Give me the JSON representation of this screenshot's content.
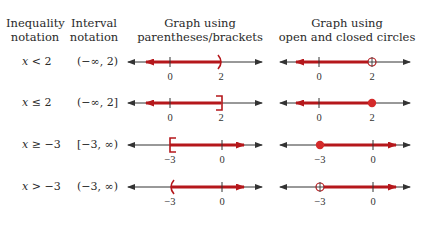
{
  "headers": {
    "inequality": [
      "Inequality",
      "notation"
    ],
    "interval": [
      "Interval",
      "notation"
    ],
    "brackets": [
      "Graph using",
      "parentheses/brackets"
    ],
    "circles": [
      "Graph using",
      "open and closed circles"
    ]
  },
  "rows": [
    {
      "inequality_var": "x",
      "inequality_rest": " < 2",
      "interval": "(−∞, 2)",
      "tick_labels": [
        "0",
        "2"
      ],
      "endpoint": 2,
      "direction": "left",
      "bracket_style": "parenthesis",
      "circle_style": "open"
    },
    {
      "inequality_var": "x",
      "inequality_rest": " ≤ 2",
      "interval": "(−∞, 2]",
      "tick_labels": [
        "0",
        "2"
      ],
      "endpoint": 2,
      "direction": "left",
      "bracket_style": "bracket",
      "circle_style": "closed"
    },
    {
      "inequality_var": "x",
      "inequality_rest": " ≥ −3",
      "interval": "[−3, ∞)",
      "tick_labels": [
        "−3",
        "0"
      ],
      "endpoint": -3,
      "direction": "right",
      "bracket_style": "bracket",
      "circle_style": "closed"
    },
    {
      "inequality_var": "x",
      "inequality_rest": " > −3",
      "interval": "(−3, ∞)",
      "tick_labels": [
        "−3",
        "0"
      ],
      "endpoint": -3,
      "direction": "right",
      "bracket_style": "parenthesis",
      "circle_style": "open"
    }
  ],
  "colors": {
    "ray": "#b5171b",
    "axis": "#333333",
    "dot": "#d42a2a"
  }
}
